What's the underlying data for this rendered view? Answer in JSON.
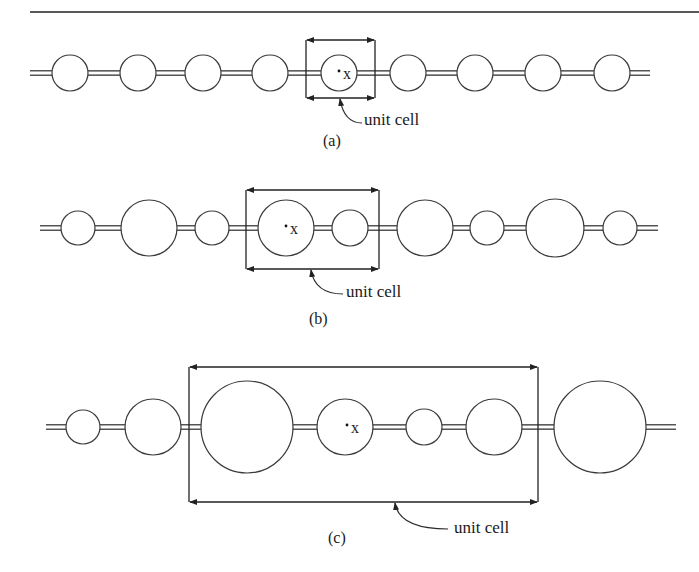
{
  "figure": {
    "panels": [
      {
        "id": "a",
        "panel_label": "(a)",
        "cell_label": "unit cell",
        "origin_marker": "x",
        "chain_y": 73,
        "chain_x": [
          30,
          650
        ],
        "beads": [
          {
            "cx": 70,
            "r": 18
          },
          {
            "cx": 138,
            "r": 18
          },
          {
            "cx": 203,
            "r": 18
          },
          {
            "cx": 270,
            "r": 18
          },
          {
            "cx": 339,
            "r": 18
          },
          {
            "cx": 408,
            "r": 18
          },
          {
            "cx": 475,
            "r": 18
          },
          {
            "cx": 543,
            "r": 18
          },
          {
            "cx": 612,
            "r": 18
          }
        ],
        "cell_box": {
          "x1": 306,
          "x2": 375,
          "y1": 40,
          "y2": 98
        },
        "marker": {
          "x": 339,
          "y": 73
        },
        "label_pos": {
          "x": 364,
          "y": 129
        },
        "panel_pos": {
          "x": 323,
          "y": 150
        },
        "arrow_from": {
          "x": 362,
          "y": 123
        },
        "arrow_to": {
          "x": 340,
          "y": 99
        }
      },
      {
        "id": "b",
        "panel_label": "(b)",
        "cell_label": "unit cell",
        "origin_marker": "x",
        "chain_y": 228,
        "chain_x": [
          40,
          658
        ],
        "beads": [
          {
            "cx": 78,
            "r": 17
          },
          {
            "cx": 149,
            "r": 28
          },
          {
            "cx": 212,
            "r": 17
          },
          {
            "cx": 286,
            "r": 28
          },
          {
            "cx": 350,
            "r": 18
          },
          {
            "cx": 425,
            "r": 28
          },
          {
            "cx": 487,
            "r": 17
          },
          {
            "cx": 555,
            "r": 29
          },
          {
            "cx": 620,
            "r": 17
          }
        ],
        "cell_box": {
          "x1": 246,
          "x2": 379,
          "y1": 190,
          "y2": 269
        },
        "marker": {
          "x": 286,
          "y": 228
        },
        "label_pos": {
          "x": 346,
          "y": 301
        },
        "panel_pos": {
          "x": 309,
          "y": 328
        },
        "arrow_from": {
          "x": 343,
          "y": 294
        },
        "arrow_to": {
          "x": 311,
          "y": 270
        }
      },
      {
        "id": "c",
        "panel_label": "(c)",
        "cell_label": "unit cell",
        "origin_marker": "x",
        "chain_y": 427,
        "chain_x": [
          46,
          676
        ],
        "beads": [
          {
            "cx": 83,
            "r": 17
          },
          {
            "cx": 153,
            "r": 28
          },
          {
            "cx": 247,
            "r": 46
          },
          {
            "cx": 345,
            "r": 28
          },
          {
            "cx": 424,
            "r": 18
          },
          {
            "cx": 494,
            "r": 28
          },
          {
            "cx": 600,
            "r": 46
          }
        ],
        "cell_box": {
          "x1": 189,
          "x2": 538,
          "y1": 367,
          "y2": 502
        },
        "marker": {
          "x": 347,
          "y": 427
        },
        "label_pos": {
          "x": 454,
          "y": 537
        },
        "panel_pos": {
          "x": 328,
          "y": 547
        },
        "arrow_from": {
          "x": 448,
          "y": 529
        },
        "arrow_to": {
          "x": 395,
          "y": 503
        }
      }
    ]
  }
}
